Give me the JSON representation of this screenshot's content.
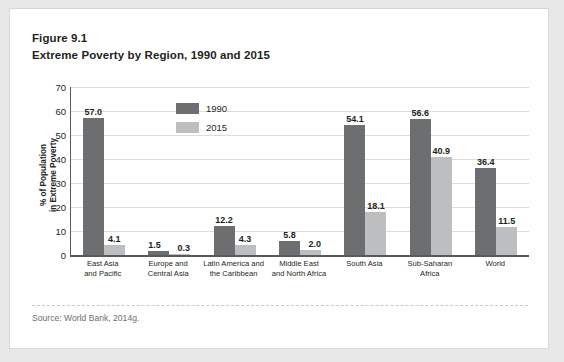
{
  "figure": {
    "number": "Figure 9.1",
    "title": "Extreme Poverty by Region, 1990 and 2015",
    "source": "Source: World Bank, 2014g."
  },
  "colors": {
    "series_1990": "#6d6e70",
    "series_2015": "#bcbec0",
    "axis": "#58595b",
    "gridline": "#dcdcdc",
    "text": "#231f20",
    "card_background": "#ffffff",
    "page_background": "#e8e8e8"
  },
  "legend": {
    "items": [
      {
        "label": "1990",
        "swatch": "#6d6e70"
      },
      {
        "label": "2015",
        "swatch": "#bcbec0"
      }
    ]
  },
  "axes": {
    "y_title": "% of Population\nin Extreme Poverty",
    "y_ticks": [
      "70",
      "60",
      "50",
      "40",
      "30",
      "20",
      "10",
      "0"
    ]
  },
  "chart_data": {
    "type": "bar",
    "title": "Extreme Poverty by Region, 1990 and 2015",
    "xlabel": "",
    "ylabel": "% of Population in Extreme Poverty",
    "ylim": [
      0,
      70
    ],
    "ytick_step": 10,
    "grid": true,
    "legend_position": "inside-top-left",
    "categories": [
      "East Asia\nand Pacific",
      "Europe and\nCentral Asia",
      "Latin America and\nthe Caribbean",
      "Middle East\nand North Africa",
      "South Asia",
      "Sub-Saharan\nAfrica",
      "World"
    ],
    "series": [
      {
        "name": "1990",
        "color": "#6d6e70",
        "values": [
          57.0,
          1.5,
          12.2,
          5.8,
          54.1,
          56.6,
          36.4
        ],
        "labels": [
          "57.0",
          "1.5",
          "12.2",
          "5.8",
          "54.1",
          "56.6",
          "36.4"
        ]
      },
      {
        "name": "2015",
        "color": "#bcbec0",
        "values": [
          4.1,
          0.3,
          4.3,
          2.0,
          18.1,
          40.9,
          11.5
        ],
        "labels": [
          "4.1",
          "0.3",
          "4.3",
          "2.0",
          "18.1",
          "40.9",
          "11.5"
        ]
      }
    ]
  }
}
